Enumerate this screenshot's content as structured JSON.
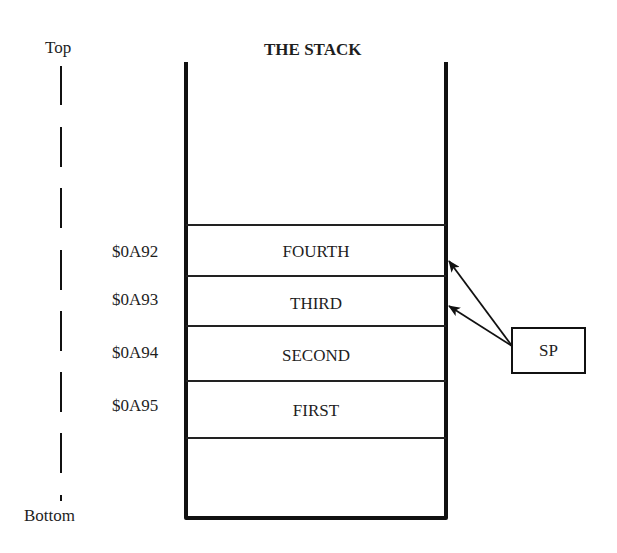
{
  "diagram": {
    "title": "THE STACK",
    "axis": {
      "top_label": "Top",
      "bottom_label": "Bottom"
    },
    "stack_cells": [
      {
        "address": "$0A92",
        "content": "FOURTH"
      },
      {
        "address": "$0A93",
        "content": "THIRD"
      },
      {
        "address": "$0A94",
        "content": "SECOND"
      },
      {
        "address": "$0A95",
        "content": "FIRST"
      }
    ],
    "pointer": {
      "label": "SP",
      "points_to": [
        "$0A92",
        "$0A93"
      ]
    },
    "colors": {
      "line": "#111111",
      "text": "#1e1e1e",
      "background": "#ffffff"
    }
  }
}
